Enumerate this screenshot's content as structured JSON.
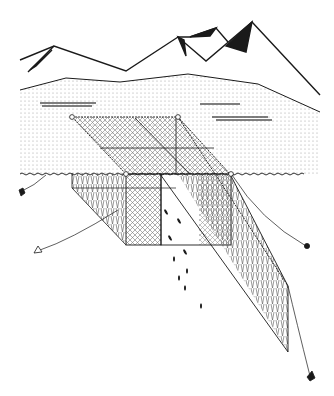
{
  "diagram": {
    "type": "line-art illustration",
    "elements": [
      {
        "name": "mountain-range",
        "description": "jagged mountain skyline with dark shaded faces"
      },
      {
        "name": "far-shoreline",
        "description": "low hill line above water"
      },
      {
        "name": "water-surface",
        "description": "dotted stippled water area down to wave line"
      },
      {
        "name": "surface-wave-line",
        "description": "horizontal wavy water line with floats"
      },
      {
        "name": "net-leader",
        "description": "long slanted mesh panel extending down-right"
      },
      {
        "name": "trap-box",
        "description": "rectangular mesh box (crib) at center"
      },
      {
        "name": "wing-net",
        "description": "slanted mesh wing on left"
      },
      {
        "name": "floats",
        "description": "small circles marking float positions on headrope"
      },
      {
        "name": "anchors",
        "description": "five anchors with mooring lines"
      },
      {
        "name": "fish",
        "description": "small dark fish shapes swimming toward the net"
      }
    ],
    "colors": {
      "ink": "#1a1a1a",
      "stipple": "#9a9a9a",
      "mesh": "#555555",
      "background": "#ffffff"
    }
  }
}
